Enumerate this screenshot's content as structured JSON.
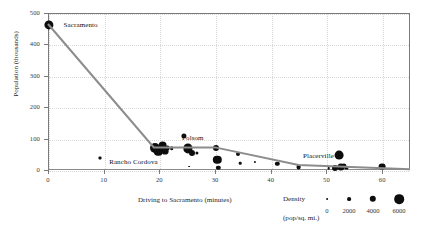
{
  "chart_data": {
    "type": "scatter",
    "title": "",
    "xlabel": "Driving to Sacramento (minutes)",
    "ylabel": "Population (thousands)",
    "xlim": [
      0,
      65
    ],
    "ylim": [
      0,
      500
    ],
    "xticks": [
      0,
      10,
      20,
      30,
      40,
      50,
      60
    ],
    "yticks": [
      0,
      100,
      200,
      300,
      400,
      500
    ],
    "grid": true,
    "size_encoding": "Density (pop/sq. mi.)",
    "points": [
      {
        "x": 0.0,
        "y": 465,
        "r": 4.6,
        "label": "Sacramento",
        "label_dx": 8,
        "label_dy": 0
      },
      {
        "x": 9.2,
        "y": 40,
        "r": 1.5,
        "label": "",
        "shape": "square"
      },
      {
        "x": 19.0,
        "y": 72,
        "r": 5.0,
        "label": ""
      },
      {
        "x": 19.6,
        "y": 62,
        "r": 4.2,
        "label": ""
      },
      {
        "x": 20.4,
        "y": 80,
        "r": 4.4,
        "label": ""
      },
      {
        "x": 20.8,
        "y": 64,
        "r": 3.4,
        "label": ""
      },
      {
        "x": 21.3,
        "y": 74,
        "r": 2.4,
        "label": ""
      },
      {
        "x": 22.0,
        "y": 72,
        "r": 1.8,
        "label": ""
      },
      {
        "x": 24.2,
        "y": 112,
        "r": 2.6,
        "label": ""
      },
      {
        "x": 25.0,
        "y": 72,
        "r": 4.6,
        "label": ""
      },
      {
        "x": 25.7,
        "y": 58,
        "r": 3.0,
        "label": ""
      },
      {
        "x": 26.5,
        "y": 58,
        "r": 1.6,
        "label": ""
      },
      {
        "x": 25.2,
        "y": 14,
        "r": 0.9,
        "label": ""
      },
      {
        "x": 30.0,
        "y": 72,
        "r": 3.0,
        "label": "Folsom",
        "label_dx": -4,
        "label_dy": -10
      },
      {
        "x": 30.2,
        "y": 36,
        "r": 4.2,
        "label": ""
      },
      {
        "x": 30.4,
        "y": 10,
        "r": 2.2,
        "label": ""
      },
      {
        "x": 34.0,
        "y": 54,
        "r": 2.0,
        "label": ""
      },
      {
        "x": 34.3,
        "y": 24,
        "r": 1.3,
        "label": ""
      },
      {
        "x": 37.0,
        "y": 30,
        "r": 1.1,
        "label": ""
      },
      {
        "x": 41.0,
        "y": 22,
        "r": 2.2,
        "label": ""
      },
      {
        "x": 44.8,
        "y": 12,
        "r": 2.4,
        "label": "Placerville",
        "label_dx": 0,
        "label_dy": -11
      },
      {
        "x": 50.2,
        "y": 8,
        "r": 1.3,
        "label": ""
      },
      {
        "x": 51.4,
        "y": 10,
        "r": 3.0,
        "label": ""
      },
      {
        "x": 52.1,
        "y": 50,
        "r": 4.4,
        "label": ""
      },
      {
        "x": 52.4,
        "y": 12,
        "r": 3.6,
        "label": ""
      },
      {
        "x": 52.9,
        "y": 16,
        "r": 2.6,
        "label": ""
      },
      {
        "x": 53.4,
        "y": 10,
        "r": 1.6,
        "label": ""
      },
      {
        "x": 59.8,
        "y": 14,
        "r": 3.4,
        "label": ""
      }
    ],
    "trend_line": {
      "color": "#8c8c8c",
      "width": 2.0,
      "vertices": [
        {
          "x": 0.0,
          "y": 465
        },
        {
          "x": 19.0,
          "y": 72
        },
        {
          "x": 30.0,
          "y": 72
        },
        {
          "x": 45.0,
          "y": 16
        },
        {
          "x": 65.0,
          "y": 2
        }
      ]
    },
    "legend": {
      "title": "Density",
      "subtitle": "(pop/sq. mi.)",
      "values": [
        "0",
        "2000",
        "4000",
        "6000"
      ],
      "radii": [
        0.9,
        1.9,
        3.2,
        4.8
      ]
    }
  }
}
